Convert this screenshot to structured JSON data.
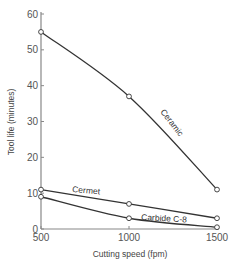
{
  "chart_data": {
    "type": "line",
    "title": "",
    "xlabel": "Cutting speed (fpm)",
    "ylabel": "Tool life (minutes)",
    "x": [
      500,
      1000,
      1500
    ],
    "xticks": [
      "500",
      "1000",
      "1500"
    ],
    "yticks": [
      "0",
      "10",
      "20",
      "30",
      "40",
      "50",
      "60"
    ],
    "xlim": [
      500,
      1500
    ],
    "ylim": [
      0,
      60
    ],
    "grid": false,
    "legend": "inline labels",
    "series": [
      {
        "name": "Ceramic",
        "values": [
          55,
          37,
          11
        ]
      },
      {
        "name": "Cermet",
        "values": [
          11,
          7,
          3
        ]
      },
      {
        "name": "Carbide C-8",
        "values": [
          9,
          3,
          0.5
        ]
      }
    ]
  },
  "colors": {
    "line": "#333333",
    "axis": "#888888",
    "marker_fill": "#ffffff"
  }
}
